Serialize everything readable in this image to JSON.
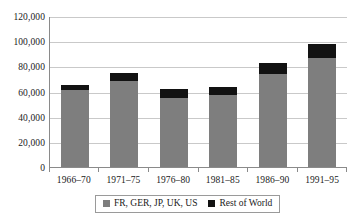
{
  "chart_data": {
    "type": "bar",
    "title": "",
    "subtitle": "",
    "xlabel": "",
    "ylabel": "",
    "stacked": true,
    "grid": true,
    "legend_position": "bottom",
    "ylim": [
      0,
      120000
    ],
    "yticks": [
      0,
      20000,
      40000,
      60000,
      80000,
      100000,
      120000
    ],
    "ytick_labels": [
      "0",
      "20,000",
      "40,000",
      "60,000",
      "80,000",
      "100,000",
      "120,000"
    ],
    "categories": [
      "1966–70",
      "1971–75",
      "1976–80",
      "1981–85",
      "1986–90",
      "1991–95"
    ],
    "series": [
      {
        "name": "FR, GER, JP, UK, US",
        "color": "#7e7e7e",
        "values": [
          61000,
          68000,
          55000,
          57000,
          74000,
          87000
        ]
      },
      {
        "name": "Rest of World",
        "color": "#121212",
        "values": [
          4000,
          7000,
          7000,
          6500,
          9000,
          11000
        ]
      }
    ],
    "totals": [
      65000,
      75000,
      62000,
      63500,
      83000,
      98000
    ]
  },
  "legend": {
    "items": [
      {
        "label": "FR, GER, JP, UK, US",
        "swatch": "gray"
      },
      {
        "label": "Rest of World",
        "swatch": "black"
      }
    ]
  },
  "colors": {
    "series_gray": "#7e7e7e",
    "series_black": "#121212",
    "gridline": "#c9c9c9",
    "axis": "#8a8a8a",
    "background": "#ffffff",
    "text": "#1a1a1a"
  }
}
